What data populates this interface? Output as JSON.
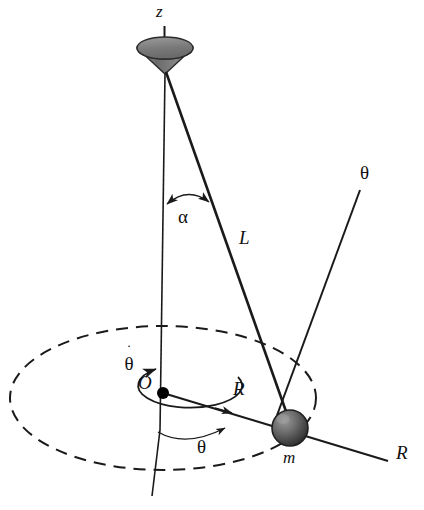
{
  "figure": {
    "background_color": "#ffffff",
    "stroke_color": "#1a1a1a",
    "width": 424,
    "height": 510
  },
  "labels": {
    "z_axis": "z",
    "alpha_angle": "α",
    "string_length": "L",
    "theta_axis": "θ",
    "origin": "O",
    "radius_mid": "R",
    "radius_axis": "R",
    "mass": "m",
    "theta_angle": "θ",
    "theta_dot_glyph": "θ",
    "theta_dot_overdot": "˙"
  },
  "elements": {
    "cone": {
      "name": "support-cone",
      "fill": "#6e6e6e"
    },
    "bob": {
      "name": "pendulum-mass-sphere",
      "fill": "#5a5a5a",
      "radius_px": 18
    },
    "orbit": {
      "name": "dashed-orbit-ellipse",
      "style": "dashed"
    },
    "origin_dot": {
      "name": "origin-point",
      "fill": "#000000"
    }
  },
  "geometry": {
    "cone_apex": [
      165,
      73
    ],
    "origin": [
      163,
      393
    ],
    "bob_center": [
      290,
      428
    ],
    "orbit_center": [
      163,
      398
    ],
    "orbit_rx": 155,
    "orbit_ry": 72
  }
}
